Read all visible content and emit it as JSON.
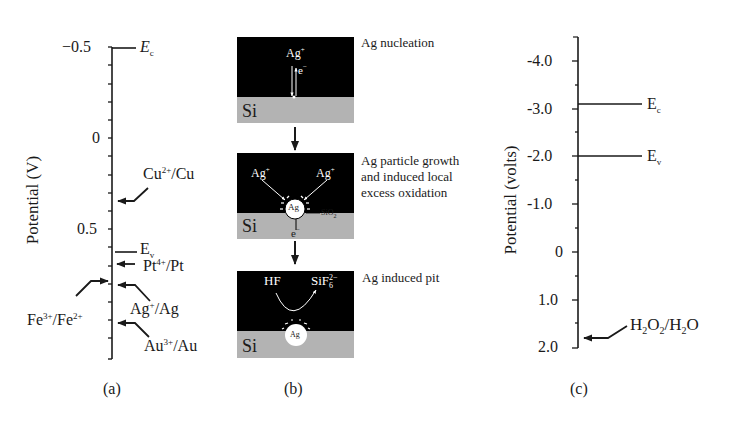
{
  "panel_a": {
    "caption": "(a)",
    "axis_label": "Potential (V)",
    "ticks": [
      {
        "label": "−0.5",
        "value": -0.5
      },
      {
        "label": "0",
        "value": 0
      },
      {
        "label": "0.5",
        "value": 0.5
      }
    ],
    "levels": [
      {
        "name": "E",
        "sub": "c",
        "italic": true,
        "value": -0.5
      },
      {
        "name": "Cu",
        "sup": "2+",
        "suffix": "/Cu",
        "value": 0.34
      },
      {
        "name": "E",
        "sub": "v",
        "value": 0.63
      },
      {
        "name": "Pt",
        "sup": "4+",
        "suffix": "/Pt",
        "value": 0.7
      },
      {
        "name": "Fe",
        "sup": "3+",
        "suffix": "/Fe",
        "sup2": "2+",
        "value": 0.74
      },
      {
        "name": "Ag",
        "sup": "+",
        "suffix": "/Ag",
        "value": 0.8
      },
      {
        "name": "Au",
        "sup": "3+",
        "suffix": "/Au",
        "value": 1.0
      }
    ]
  },
  "panel_b": {
    "caption": "(b)",
    "steps": [
      {
        "title": "Ag nucleation",
        "substrate": "Si",
        "ion": "Ag",
        "ion_sup": "+",
        "electron": "e",
        "electron_sup": "−"
      },
      {
        "title_lines": [
          "Ag particle growth",
          "and induced local",
          "excess oxidation"
        ],
        "substrate": "Si",
        "ion_left": "Ag",
        "ion_right": "Ag",
        "ion_sup": "+",
        "particle": "Ag",
        "oxide": "SiO",
        "oxide_sub": "2",
        "electron": "e",
        "electron_sup": "−"
      },
      {
        "title": "Ag induced pit",
        "substrate": "Si",
        "reactant": "HF",
        "product": "SiF",
        "product_sub": "6",
        "product_sup": "2−",
        "particle": "Ag"
      }
    ]
  },
  "panel_c": {
    "caption": "(c)",
    "axis_label": "Potential (volts)",
    "ticks": [
      {
        "label": "-4.0",
        "value": -4.0
      },
      {
        "label": "-3.0",
        "value": -3.0
      },
      {
        "label": "-2.0",
        "value": -2.0
      },
      {
        "label": "-1.0",
        "value": -1.0
      },
      {
        "label": "0",
        "value": 0
      },
      {
        "label": "1.0",
        "value": 1.0
      },
      {
        "label": "2.0",
        "value": 2.0
      }
    ],
    "levels": [
      {
        "name": "E",
        "sub": "c",
        "value": -3.1
      },
      {
        "name": "E",
        "sub": "v",
        "value": -2.0
      },
      {
        "name": "H2O2/H2O",
        "value": 1.77
      }
    ]
  },
  "colors": {
    "ink": "#1a1a1a",
    "solution": "#000000",
    "silicon": "#b3b3b3",
    "particle": "#ffffff"
  }
}
